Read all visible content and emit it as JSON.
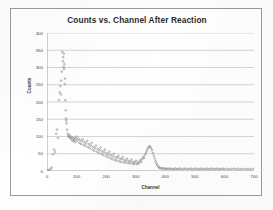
{
  "chart_data": {
    "type": "scatter",
    "title": "Counts vs. Channel After Reaction",
    "xlabel": "Channel",
    "ylabel": "Counts",
    "xlim": [
      0,
      700
    ],
    "ylim": [
      0,
      400
    ],
    "xticks": [
      0,
      100,
      200,
      300,
      400,
      500,
      600,
      700
    ],
    "yticks": [
      0,
      50,
      100,
      150,
      200,
      250,
      300,
      350,
      400
    ],
    "grid": "horizontal",
    "legend": "none",
    "marker_color": "#8a8a8a",
    "series": [
      {
        "name": "Counts",
        "points": [
          [
            4,
            2
          ],
          [
            8,
            3
          ],
          [
            12,
            6
          ],
          [
            16,
            10
          ],
          [
            20,
            48
          ],
          [
            24,
            62
          ],
          [
            28,
            55
          ],
          [
            31,
            108
          ],
          [
            34,
            120
          ],
          [
            37,
            96
          ],
          [
            40,
            205
          ],
          [
            43,
            228
          ],
          [
            45,
            246
          ],
          [
            47,
            222
          ],
          [
            48,
            262
          ],
          [
            50,
            288
          ],
          [
            52,
            345
          ],
          [
            54,
            318
          ],
          [
            55,
            330
          ],
          [
            56,
            302
          ],
          [
            57,
            340
          ],
          [
            58,
            296
          ],
          [
            59,
            310
          ],
          [
            60,
            252
          ],
          [
            61,
            268
          ],
          [
            62,
            205
          ],
          [
            63,
            176
          ],
          [
            64,
            152
          ],
          [
            65,
            146
          ],
          [
            66,
            138
          ],
          [
            68,
            120
          ],
          [
            70,
            108
          ],
          [
            72,
            102
          ],
          [
            74,
            98
          ],
          [
            76,
            104
          ],
          [
            78,
            96
          ],
          [
            80,
            100
          ],
          [
            82,
            92
          ],
          [
            84,
            98
          ],
          [
            86,
            88
          ],
          [
            88,
            94
          ],
          [
            90,
            86
          ],
          [
            92,
            90
          ],
          [
            94,
            96
          ],
          [
            96,
            84
          ],
          [
            98,
            92
          ],
          [
            100,
            100
          ],
          [
            103,
            88
          ],
          [
            106,
            94
          ],
          [
            109,
            82
          ],
          [
            112,
            90
          ],
          [
            115,
            78
          ],
          [
            118,
            86
          ],
          [
            121,
            92
          ],
          [
            124,
            76
          ],
          [
            127,
            84
          ],
          [
            130,
            72
          ],
          [
            133,
            80
          ],
          [
            136,
            88
          ],
          [
            139,
            70
          ],
          [
            142,
            78
          ],
          [
            145,
            66
          ],
          [
            148,
            74
          ],
          [
            151,
            82
          ],
          [
            154,
            62
          ],
          [
            157,
            70
          ],
          [
            160,
            58
          ],
          [
            163,
            66
          ],
          [
            166,
            74
          ],
          [
            169,
            56
          ],
          [
            172,
            64
          ],
          [
            175,
            52
          ],
          [
            178,
            60
          ],
          [
            181,
            68
          ],
          [
            184,
            50
          ],
          [
            187,
            58
          ],
          [
            190,
            46
          ],
          [
            193,
            54
          ],
          [
            196,
            62
          ],
          [
            199,
            44
          ],
          [
            202,
            52
          ],
          [
            205,
            40
          ],
          [
            208,
            48
          ],
          [
            211,
            56
          ],
          [
            214,
            38
          ],
          [
            217,
            46
          ],
          [
            220,
            34
          ],
          [
            223,
            42
          ],
          [
            226,
            50
          ],
          [
            229,
            32
          ],
          [
            232,
            40
          ],
          [
            235,
            30
          ],
          [
            238,
            38
          ],
          [
            241,
            44
          ],
          [
            244,
            28
          ],
          [
            247,
            36
          ],
          [
            250,
            26
          ],
          [
            253,
            34
          ],
          [
            256,
            40
          ],
          [
            259,
            25
          ],
          [
            262,
            32
          ],
          [
            265,
            24
          ],
          [
            268,
            30
          ],
          [
            271,
            36
          ],
          [
            274,
            23
          ],
          [
            277,
            29
          ],
          [
            280,
            22
          ],
          [
            283,
            27
          ],
          [
            286,
            33
          ],
          [
            289,
            21
          ],
          [
            292,
            26
          ],
          [
            295,
            20
          ],
          [
            298,
            25
          ],
          [
            301,
            30
          ],
          [
            304,
            20
          ],
          [
            307,
            24
          ],
          [
            310,
            22
          ],
          [
            313,
            28
          ],
          [
            316,
            32
          ],
          [
            319,
            26
          ],
          [
            322,
            34
          ],
          [
            325,
            40
          ],
          [
            328,
            38
          ],
          [
            331,
            46
          ],
          [
            334,
            52
          ],
          [
            337,
            58
          ],
          [
            340,
            64
          ],
          [
            343,
            68
          ],
          [
            346,
            72
          ],
          [
            349,
            70
          ],
          [
            352,
            66
          ],
          [
            355,
            60
          ],
          [
            358,
            52
          ],
          [
            361,
            44
          ],
          [
            364,
            36
          ],
          [
            367,
            28
          ],
          [
            370,
            22
          ],
          [
            373,
            17
          ],
          [
            376,
            13
          ],
          [
            379,
            10
          ],
          [
            382,
            9
          ],
          [
            386,
            8
          ],
          [
            390,
            7
          ],
          [
            394,
            8
          ],
          [
            398,
            6
          ],
          [
            402,
            7
          ],
          [
            406,
            6
          ],
          [
            410,
            7
          ],
          [
            415,
            6
          ],
          [
            420,
            7
          ],
          [
            425,
            5
          ],
          [
            430,
            6
          ],
          [
            435,
            7
          ],
          [
            440,
            5
          ],
          [
            445,
            6
          ],
          [
            450,
            7
          ],
          [
            456,
            5
          ],
          [
            462,
            6
          ],
          [
            468,
            7
          ],
          [
            474,
            5
          ],
          [
            480,
            6
          ],
          [
            486,
            7
          ],
          [
            492,
            5
          ],
          [
            498,
            6
          ],
          [
            504,
            7
          ],
          [
            510,
            5
          ],
          [
            516,
            6
          ],
          [
            522,
            7
          ],
          [
            528,
            5
          ],
          [
            534,
            6
          ],
          [
            540,
            7
          ],
          [
            546,
            5
          ],
          [
            552,
            6
          ],
          [
            558,
            7
          ],
          [
            564,
            5
          ],
          [
            570,
            6
          ],
          [
            576,
            7
          ],
          [
            582,
            5
          ],
          [
            588,
            6
          ],
          [
            594,
            7
          ],
          [
            600,
            5
          ],
          [
            608,
            6
          ],
          [
            616,
            5
          ],
          [
            624,
            6
          ],
          [
            632,
            7
          ],
          [
            640,
            5
          ],
          [
            648,
            6
          ],
          [
            656,
            5
          ],
          [
            664,
            6
          ],
          [
            672,
            5
          ],
          [
            680,
            6
          ],
          [
            688,
            5
          ],
          [
            696,
            6
          ]
        ]
      }
    ]
  }
}
